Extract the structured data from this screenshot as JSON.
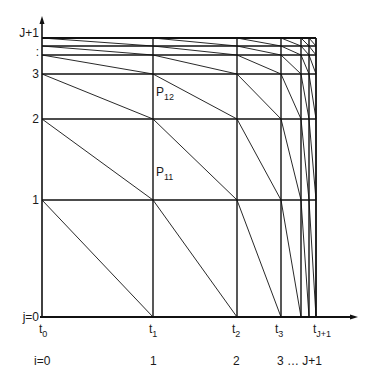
{
  "diagram": {
    "colors": {
      "line": "#111111",
      "background": "#ffffff"
    },
    "x_grid": [
      42,
      153,
      237,
      281,
      301,
      309,
      316
    ],
    "y_grid": [
      317,
      200,
      119,
      74,
      55,
      46,
      38
    ],
    "y_labels": [
      {
        "text": "j=0",
        "y": 317
      },
      {
        "text": "1",
        "y": 200
      },
      {
        "text": "2",
        "y": 119
      },
      {
        "text": "3",
        "y": 74
      },
      {
        "text": ":",
        "y": 52
      },
      {
        "text": "J+1",
        "y": 33
      }
    ],
    "t_labels": [
      {
        "base": "t",
        "sub": "0",
        "x": 42
      },
      {
        "base": "t",
        "sub": "1",
        "x": 152
      },
      {
        "base": "t",
        "sub": "2",
        "x": 235
      },
      {
        "base": "t",
        "sub": "3",
        "x": 278
      },
      {
        "base": "t",
        "sub": "J+1",
        "x": 316
      }
    ],
    "i_labels": [
      {
        "text": "i=0",
        "x": 34
      },
      {
        "text": "1",
        "x": 150
      },
      {
        "text": "2",
        "x": 233
      },
      {
        "text": "3  …  J+1",
        "x": 277
      }
    ],
    "points": [
      {
        "base": "P",
        "sub": "12",
        "x": 156,
        "y": 100
      },
      {
        "base": "P",
        "sub": "11",
        "x": 156,
        "y": 180
      }
    ]
  }
}
